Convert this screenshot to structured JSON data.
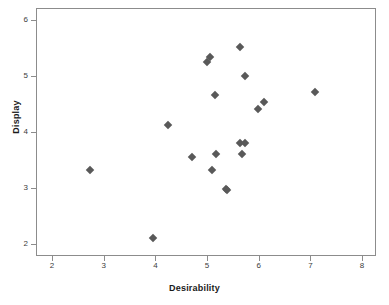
{
  "chart_data": {
    "type": "scatter",
    "title": "",
    "xlabel": "Desirability",
    "ylabel": "Display",
    "xlim": [
      1.69,
      8.27
    ],
    "ylim": [
      1.79,
      6.22
    ],
    "xticks": [
      2,
      3,
      4,
      5,
      6,
      7,
      8
    ],
    "yticks": [
      2,
      3,
      4,
      5,
      6
    ],
    "xtick_labels": [
      "2",
      "3",
      "4",
      "5",
      "6",
      "7",
      "8"
    ],
    "ytick_labels": [
      "2",
      "3",
      "4",
      "5",
      "6"
    ],
    "grid": false,
    "legend": null,
    "marker": "diamond",
    "marker_color": "#595959",
    "frame_color": "#8c8c8c",
    "background": "#ffffff",
    "points": [
      {
        "x": 2.74,
        "y": 3.32
      },
      {
        "x": 3.96,
        "y": 2.12
      },
      {
        "x": 4.25,
        "y": 4.13
      },
      {
        "x": 4.71,
        "y": 3.55
      },
      {
        "x": 5.0,
        "y": 5.26
      },
      {
        "x": 5.06,
        "y": 5.35
      },
      {
        "x": 5.1,
        "y": 3.32
      },
      {
        "x": 5.15,
        "y": 4.66
      },
      {
        "x": 5.17,
        "y": 3.62
      },
      {
        "x": 5.37,
        "y": 2.99
      },
      {
        "x": 5.39,
        "y": 2.97
      },
      {
        "x": 5.64,
        "y": 5.52
      },
      {
        "x": 5.64,
        "y": 3.81
      },
      {
        "x": 5.74,
        "y": 3.81
      },
      {
        "x": 5.68,
        "y": 3.62
      },
      {
        "x": 5.74,
        "y": 5.0
      },
      {
        "x": 5.99,
        "y": 4.41
      },
      {
        "x": 6.1,
        "y": 4.54
      },
      {
        "x": 7.09,
        "y": 4.72
      }
    ]
  }
}
